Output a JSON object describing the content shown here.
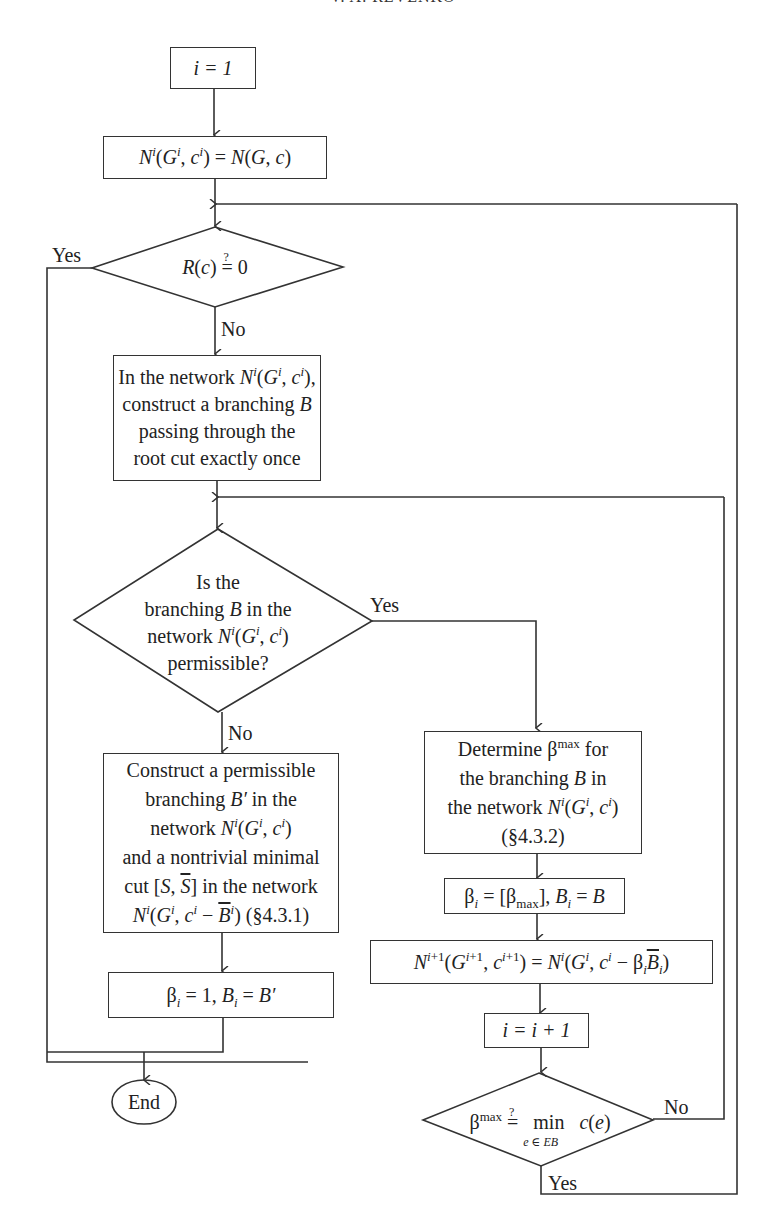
{
  "header": {
    "running_title": "V. A. REVENKO"
  },
  "nodes": {
    "init": "i = 1",
    "network_init": "N^i(G^i, c^i) = N(G, c)",
    "check_R": "R(c) ≟ 0",
    "construct_branching": [
      "In the network N^i(G^i, c^i),",
      "construct a branching B",
      "passing through the",
      "root cut exactly once"
    ],
    "is_permissible": [
      "Is the",
      "branching B in the",
      "network N^i(G^i, c^i)",
      "permissible?"
    ],
    "construct_permissible": [
      "Construct a permissible",
      "branching B′ in the",
      "network N^i(G^i, c^i)",
      "and a nontrivial minimal",
      "cut [S, S̄] in the network",
      "N^i(G^i, c^i − B̄^i) (§4.3.1)"
    ],
    "beta_one": "β_i = 1, B_i = B′",
    "end": "End",
    "determine_beta_max": [
      "Determine β^max for",
      "the branching B in",
      "the network N^i(G^i, c^i)",
      "(§4.3.2)"
    ],
    "beta_assign": "β_i = [β_max], B_i = B",
    "network_update": "N^(i+1)(G^(i+1), c^(i+1)) = N^i(G^i, c^i − β_i B̄_i)",
    "increment": "i = i + 1",
    "check_beta_max": "β^max ≟ min_(e ∈ EB) c(e)"
  },
  "edge_labels": {
    "check_R_yes": "Yes",
    "check_R_no": "No",
    "permissible_yes": "Yes",
    "permissible_no": "No",
    "beta_max_no": "No",
    "beta_max_yes": "Yes"
  },
  "text": {
    "network": "network",
    "in_the_network": "In the network",
    "construct_b": "construct a branching",
    "passing": "passing through the",
    "root_cut": "root cut exactly once",
    "is_the": "Is the",
    "branching": "branching",
    "in_the": "in the",
    "permissible_q": "permissible?",
    "construct_perm": "Construct a permissible",
    "and_nontrivial": "and a nontrivial minimal",
    "cut": "cut",
    "in_the_network_lc": "in the network",
    "sec431": "(§4.3.1)",
    "determine": "Determine",
    "for": "for",
    "the_branching": "the branching",
    "in": "in",
    "the_network": "the network",
    "sec432": "(§4.3.2)",
    "min": "min",
    "min_sub": "e ∈ EB"
  },
  "colors": {
    "line": "#333333",
    "text": "#222222",
    "background": "#ffffff"
  }
}
